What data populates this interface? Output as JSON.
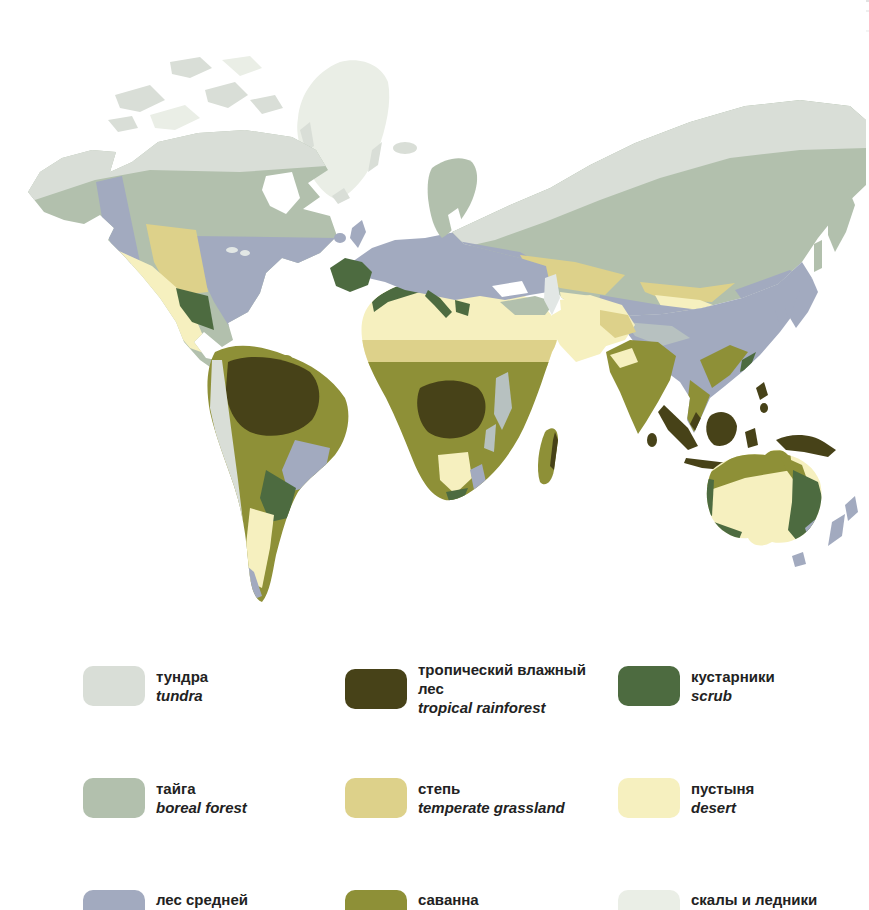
{
  "biome_colors": {
    "tundra": "#d9ded7",
    "taiga": "#b2c0ad",
    "temperate_forest": "#a2aabf",
    "tropical_rainforest": "#474218",
    "savanna": "#8e9037",
    "scrub": "#4d6b40",
    "steppe": "#ddd18a",
    "desert": "#f6f0bf",
    "rocks_glaciers": "#eaeee6",
    "highland_gray": "#b7c1c0",
    "inland_water": "#e2e7e5",
    "ocean": "#ffffff"
  },
  "legend": {
    "items": [
      {
        "id": "tundra",
        "ru": "тундра",
        "en": "tundra"
      },
      {
        "id": "tropical_rainforest",
        "ru": "тропический влажный лес",
        "en": "tropical rainforest"
      },
      {
        "id": "scrub",
        "ru": "кустарники",
        "en": "scrub"
      },
      {
        "id": "taiga",
        "ru": "тайга",
        "en": "boreal forest"
      },
      {
        "id": "steppe",
        "ru": "степь",
        "en": "temperate grassland"
      },
      {
        "id": "desert",
        "ru": "пустыня",
        "en": "desert"
      },
      {
        "id": "temperate_forest",
        "ru": "лес средней",
        "en": ""
      },
      {
        "id": "savanna",
        "ru": "саванна",
        "en": ""
      },
      {
        "id": "rocks_glaciers",
        "ru": "скалы и ледники",
        "en": ""
      }
    ]
  }
}
